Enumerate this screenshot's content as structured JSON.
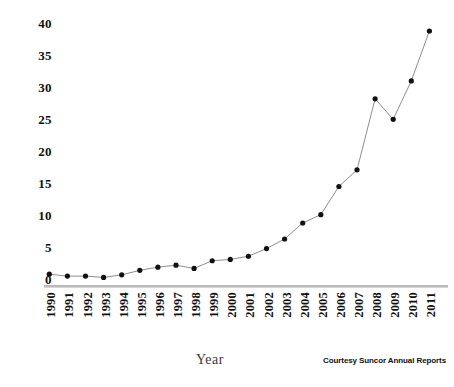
{
  "chart_data": {
    "type": "line",
    "title": "",
    "subtitle": "",
    "xlabel": "Year",
    "ylabel": "",
    "categories": [
      "1990",
      "1991",
      "1992",
      "1993",
      "1994",
      "1995",
      "1996",
      "1997",
      "1998",
      "1999",
      "2000",
      "2001",
      "2002",
      "2003",
      "2004",
      "2005",
      "2006",
      "2007",
      "2008",
      "2009",
      "2010",
      "2011"
    ],
    "values": [
      0.8,
      0.5,
      0.5,
      0.3,
      0.7,
      1.4,
      1.9,
      2.2,
      1.7,
      2.9,
      3.1,
      3.6,
      4.8,
      6.3,
      8.8,
      10.1,
      14.5,
      17.1,
      28.2,
      25.0,
      31.0,
      38.8
    ],
    "series": [
      {
        "name": "",
        "values": [
          0.8,
          0.5,
          0.5,
          0.3,
          0.7,
          1.4,
          1.9,
          2.2,
          1.7,
          2.9,
          3.1,
          3.6,
          4.8,
          6.3,
          8.8,
          10.1,
          14.5,
          17.1,
          28.2,
          25.0,
          31.0,
          38.8
        ]
      }
    ],
    "ylim": [
      0,
      40
    ],
    "yticks": [
      0,
      5,
      10,
      15,
      20,
      25,
      30,
      35,
      40
    ],
    "ytick_labels": [
      "0",
      "5",
      "10",
      "15",
      "20",
      "25",
      "30",
      "35",
      "40"
    ],
    "grid": false,
    "legend": null,
    "marker": "filled-circle",
    "marker_color": "#111111",
    "line_color": "#8e8e8e",
    "axis_color": "#b9b9b9",
    "background": "#ffffff"
  },
  "annotations": {
    "credit": "Courtesy Suncor Annual Reports"
  }
}
